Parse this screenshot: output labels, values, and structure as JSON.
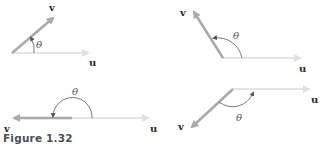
{
  "figure": {
    "caption": "Figure 1.32",
    "colors": {
      "u_vector": "#e4e4e4",
      "v_vector": "#a9a9a9",
      "arc": "#555555",
      "label": "#2b2b2b",
      "caption": "#4a4f5a"
    },
    "panels": [
      {
        "id": "acute",
        "u_label": "u",
        "v_label": "v",
        "angle_label": "θ",
        "description": "v at acute angle to u"
      },
      {
        "id": "obtuse",
        "u_label": "u",
        "v_label": "v",
        "angle_label": "θ",
        "description": "v at obtuse angle to u"
      },
      {
        "id": "straight",
        "u_label": "u",
        "v_label": "v",
        "angle_label": "θ",
        "description": "v opposite to u (180°)"
      },
      {
        "id": "reflex-below",
        "u_label": "u",
        "v_label": "v",
        "angle_label": "θ",
        "description": "v pointing down-left, angle measured below"
      }
    ]
  }
}
